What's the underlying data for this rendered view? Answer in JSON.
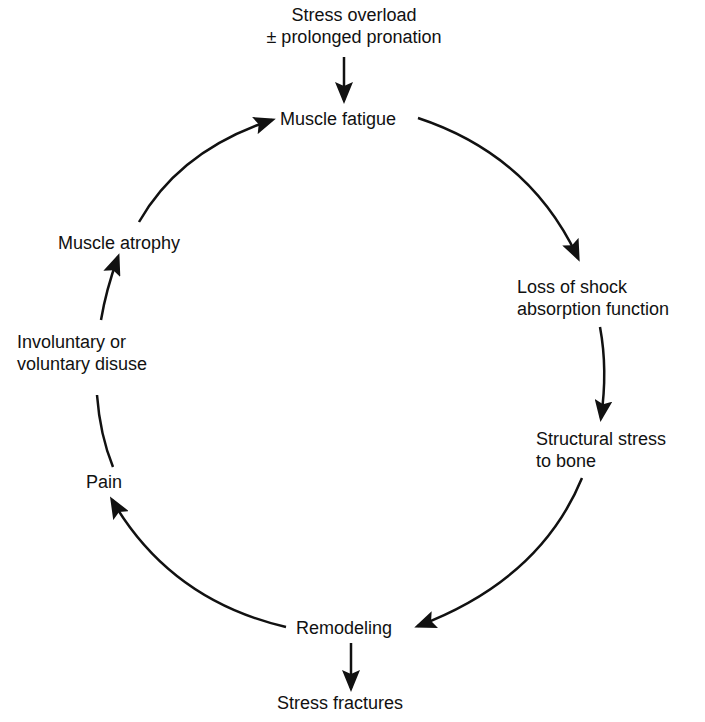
{
  "diagram": {
    "input": {
      "line1": "Stress overload",
      "line2": "± prolonged pronation"
    },
    "nodes": [
      {
        "id": "muscle-fatigue",
        "text": "Muscle fatigue"
      },
      {
        "id": "loss-shock",
        "line1": "Loss of shock",
        "line2": "absorption function"
      },
      {
        "id": "structural-stress",
        "line1": "Structural stress",
        "line2": "to bone"
      },
      {
        "id": "remodeling",
        "text": "Remodeling"
      },
      {
        "id": "pain",
        "text": "Pain"
      },
      {
        "id": "disuse",
        "line1": "Involuntary or",
        "line2": "voluntary disuse"
      },
      {
        "id": "atrophy",
        "text": "Muscle atrophy"
      }
    ],
    "output": {
      "text": "Stress fractures"
    },
    "colors": {
      "stroke": "#111111",
      "background": "#ffffff"
    }
  }
}
